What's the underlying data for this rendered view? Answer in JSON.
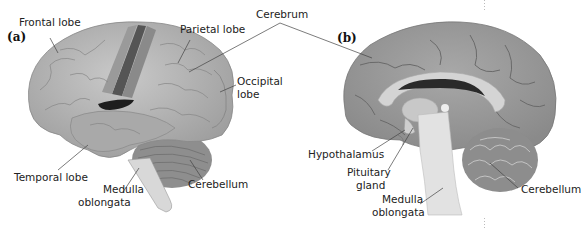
{
  "figure": {
    "panels": [
      {
        "tag": "(a)",
        "view": "lateral external view of brain",
        "labels": {
          "frontal_lobe": "Frontal lobe",
          "parietal_lobe": "Parietal lobe",
          "occipital_lobe_1": "Occipital",
          "occipital_lobe_2": "lobe",
          "temporal_lobe": "Temporal lobe",
          "medulla_1": "Medulla",
          "medulla_2": "oblongata",
          "cerebellum": "Cerebellum"
        }
      },
      {
        "tag": "(b)",
        "view": "sagittal section of brain",
        "labels": {
          "hypothalamus": "Hypothalamus",
          "pituitary_1": "Pituitary",
          "pituitary_2": "gland",
          "medulla_1": "Medulla",
          "medulla_2": "oblongata",
          "cerebellum": "Cerebellum"
        }
      }
    ],
    "shared_labels": {
      "cerebrum": "Cerebrum"
    },
    "colors": {
      "cortex_light": "#b8b8b8",
      "cortex_mid": "#9a9a9a",
      "cortex_dark": "#7c7c7c",
      "motor_strip": "#555555",
      "ventricle": "#1e1e1e",
      "brainstem": "#e2e2e2",
      "leader_line": "#444444"
    }
  }
}
